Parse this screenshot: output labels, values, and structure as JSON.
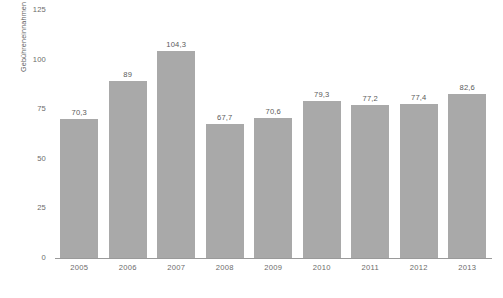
{
  "chart_data": {
    "type": "bar",
    "title": "",
    "subtitle": "",
    "xlabel": "",
    "ylabel": "Gebühreneinnahmen in Mrd. US-Dollar",
    "categories": [
      "2005",
      "2006",
      "2007",
      "2008",
      "2009",
      "2010",
      "2011",
      "2012",
      "2013"
    ],
    "values": [
      70.3,
      89,
      104.3,
      67.7,
      70.6,
      79.3,
      77.2,
      77.4,
      82.6
    ],
    "value_labels": [
      "70,3",
      "89",
      "104,3",
      "67,7",
      "70,6",
      "79,3",
      "77,2",
      "77,4",
      "82,6"
    ],
    "ylim": [
      0,
      125
    ],
    "yticks": [
      0,
      25,
      50,
      75,
      100,
      125
    ],
    "ytick_labels": [
      "0",
      "25",
      "50",
      "75",
      "100",
      "125"
    ],
    "grid": false,
    "legend": "none",
    "bar_color": "#a9a9a9",
    "axis_color": "#9a9a9a",
    "text_color": "#5a5a5a",
    "background": "#ffffff"
  }
}
